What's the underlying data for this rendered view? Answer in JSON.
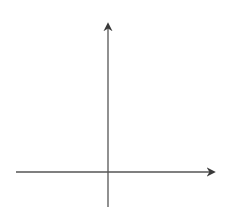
{
  "axes": {
    "x_label": "x",
    "y_label": "y",
    "x_range": [
      -8,
      8
    ],
    "y_range": [
      -3,
      11.3
    ],
    "grid": true
  },
  "curves": [
    {
      "label": "y = x",
      "superscript": "2",
      "suffix": "",
      "shift": 0
    },
    {
      "label": "y = (x − 2)",
      "superscript": "2",
      "suffix": "",
      "shift": 2
    }
  ],
  "colors": {
    "grid": "#d4d4d4",
    "axis": "#555555",
    "curve": "#3a3a3a"
  },
  "chart_data": {
    "type": "line",
    "title": "",
    "xlabel": "x",
    "ylabel": "y",
    "xlim": [
      -8,
      8
    ],
    "ylim": [
      -3,
      11.3
    ],
    "grid": true,
    "series": [
      {
        "name": "y = x^2",
        "x": [
          -3.33,
          -3,
          -2,
          -1,
          0,
          1,
          2,
          3,
          3.33
        ],
        "values": [
          11.1,
          9,
          4,
          1,
          0,
          1,
          4,
          9,
          11.1
        ]
      },
      {
        "name": "y = (x - 2)^2",
        "x": [
          -1.33,
          -1,
          0,
          1,
          2,
          3,
          4,
          5,
          5.33
        ],
        "values": [
          11.1,
          9,
          4,
          1,
          0,
          1,
          4,
          9,
          11.1
        ]
      }
    ]
  }
}
